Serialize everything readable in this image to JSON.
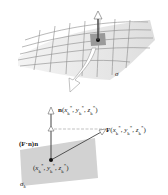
{
  "labels": {
    "sigma": "σ",
    "normal": "n(x*k, y*k, z*k)",
    "normal_bold": "n",
    "normal_args": "(x",
    "field_bold": "F",
    "projection": "(F·n)n",
    "point": "(x*k, y*k, z*k)",
    "sigma_k": "σk"
  },
  "colors": {
    "surface_fill": "#ececec",
    "grid_line": "#888888",
    "patch_fill": "#9a9a9a",
    "patch_small_fill": "#cfcfcf",
    "arrow": "#444444"
  }
}
